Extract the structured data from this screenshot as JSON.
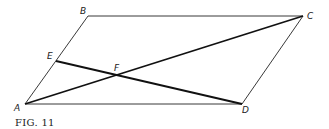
{
  "figure": {
    "caption": "FIG. 11",
    "points": {
      "A": {
        "label": "A",
        "x": 25,
        "y": 104
      },
      "B": {
        "label": "B",
        "x": 88,
        "y": 16
      },
      "C": {
        "label": "C",
        "x": 303,
        "y": 16
      },
      "D": {
        "label": "D",
        "x": 242,
        "y": 104
      },
      "E": {
        "label": "E",
        "x": 56,
        "y": 61
      },
      "F": {
        "label": "F",
        "x": 118,
        "y": 76
      }
    },
    "segments": [
      {
        "from": "A",
        "to": "B",
        "weight": "thin"
      },
      {
        "from": "B",
        "to": "C",
        "weight": "thin"
      },
      {
        "from": "C",
        "to": "D",
        "weight": "thin"
      },
      {
        "from": "D",
        "to": "A",
        "weight": "thin"
      },
      {
        "from": "A",
        "to": "C",
        "weight": "thick"
      },
      {
        "from": "E",
        "to": "D",
        "weight": "thick"
      }
    ],
    "shape": "parallelogram ABCD with diagonal AC and segment ED intersecting at F"
  }
}
